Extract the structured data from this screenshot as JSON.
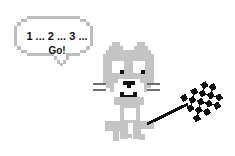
{
  "speech_bubble": {
    "line1": "1 ... 2 ... 3 ...",
    "line2": "Go!"
  },
  "colors": {
    "outline_gray": "#bdbdbd",
    "fur_gray": "#c4c4c4",
    "whisker_gray": "#6e6e6e",
    "face_white": "#ffffff",
    "ink_black": "#111111"
  },
  "characters": {
    "cat": "pixel-cat",
    "flag": "checkered-flag"
  }
}
